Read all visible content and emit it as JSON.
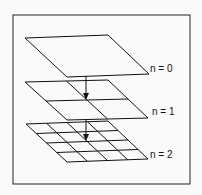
{
  "diagram": {
    "type": "multiresolution-grid-hierarchy",
    "levels": [
      {
        "label": "n = 0",
        "divisions": 1
      },
      {
        "label": "n = 1",
        "divisions": 2
      },
      {
        "label": "n = 2",
        "divisions": 4
      }
    ],
    "colors": {
      "stroke": "#111111",
      "background": "#fafafa"
    }
  }
}
